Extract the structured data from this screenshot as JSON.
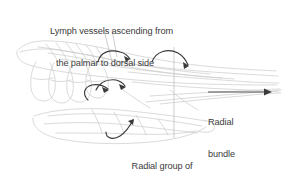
{
  "figure": {
    "type": "anatomical-line-drawing",
    "background_color": "#ffffff",
    "text_color": "#3b3b3b",
    "outline_color": "#c9c9c9",
    "vessel_color": "#3a3a3a",
    "leader_color": "#b9b9b9"
  },
  "labels": {
    "title": {
      "line1": "Lymph vessels ascending from",
      "line2": "the palmar to dorsal side"
    },
    "radial_group": {
      "line1": "Radial group of",
      "line2": "lymphatics"
    },
    "territory": {
      "line1": "Radial",
      "line2": "bundle",
      "line3": "territory"
    }
  },
  "annotations": {
    "direction_arrow": "right-arrow-icon",
    "vessel_arrows": [
      "dorsal-arrow-upper-left",
      "dorsal-arrow-upper-right",
      "palmar-arrow-middle",
      "palmar-arrow-lower"
    ],
    "leader_lines": [
      "title-leader-left",
      "title-leader-right",
      "radial-group-leader-vertical"
    ]
  }
}
